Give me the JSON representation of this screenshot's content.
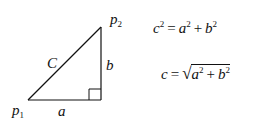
{
  "diagram": {
    "type": "right-triangle",
    "points": {
      "p1": {
        "label": "p",
        "subscript": "1"
      },
      "p2": {
        "label": "p",
        "subscript": "2"
      }
    },
    "sides": {
      "hypotenuse": "C",
      "base": "a",
      "height": "b"
    },
    "right_angle_marker": true
  },
  "equations": {
    "eq1": {
      "lhs": "c",
      "lhs_exp": "2",
      "eq": "=",
      "t1": "a",
      "t1_exp": "2",
      "plus": "+",
      "t2": "b",
      "t2_exp": "2"
    },
    "eq2": {
      "lhs": "c",
      "eq": "=",
      "sqrt": "√",
      "t1": "a",
      "t1_exp": "2",
      "plus": "+",
      "t2": "b",
      "t2_exp": "2"
    }
  }
}
